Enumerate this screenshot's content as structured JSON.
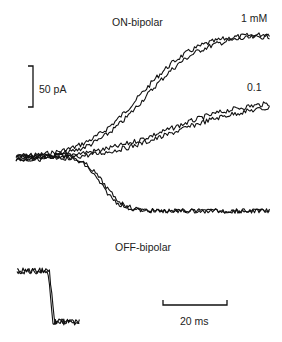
{
  "chart_data": {
    "type": "line",
    "title": "",
    "panels": [
      {
        "name": "ON-bipolar",
        "label": "ON-bipolar",
        "xlabel": "time",
        "ylabel": "current",
        "series": [
          {
            "name": "1 mM",
            "label": "1 mM",
            "direction": "outward",
            "x_ms": [
              0,
              20,
              40,
              60,
              80,
              100,
              120
            ],
            "y_pA": [
              0,
              5,
              25,
              65,
              100,
              115,
              122
            ]
          },
          {
            "name": "0.1",
            "label": "0.1",
            "direction": "outward",
            "x_ms": [
              0,
              20,
              40,
              60,
              80,
              100,
              120
            ],
            "y_pA": [
              0,
              3,
              12,
              25,
              38,
              46,
              52
            ]
          },
          {
            "name": "OFF-like inward response",
            "label": "",
            "direction": "inward",
            "x_ms": [
              0,
              20,
              40,
              60,
              80,
              100,
              120
            ],
            "y_pA": [
              0,
              -10,
              -45,
              -66,
              -67,
              -68,
              -66
            ]
          }
        ]
      },
      {
        "name": "OFF-bipolar",
        "label": "OFF-bipolar",
        "series": [
          {
            "name": "OFF-bipolar step",
            "x_ms": [
              0,
              10,
              11,
              12,
              20
            ],
            "y_pA": [
              0,
              0,
              -60,
              -62,
              -62
            ]
          }
        ]
      }
    ],
    "scale_bars": {
      "current": {
        "value": 50,
        "unit": "pA",
        "label": "50 pA"
      },
      "time": {
        "value": 20,
        "unit": "ms",
        "label": "20 ms"
      }
    },
    "grid": false,
    "legend": "inline labels at trace ends"
  },
  "labels": {
    "on_bipolar": "ON-bipolar",
    "off_bipolar": "OFF-bipolar",
    "conc_high": "1 mM",
    "conc_low": "0.1",
    "scale_current": "50 pA",
    "scale_time": "20 ms"
  }
}
